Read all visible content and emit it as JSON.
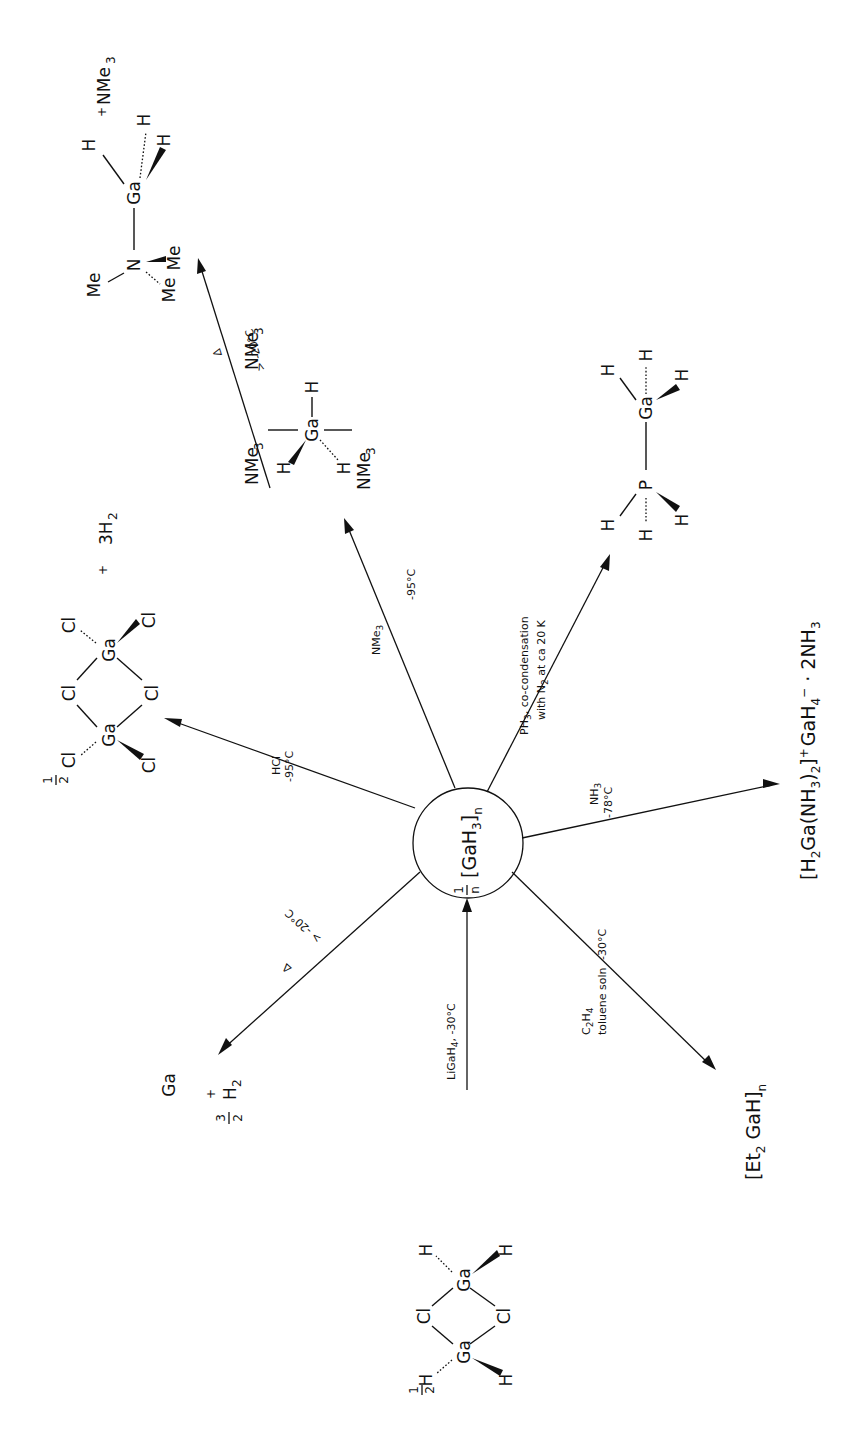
{
  "figure": {
    "orientation": "rotated 90 degrees counter-clockwise",
    "center": {
      "label_fraction_num": "1",
      "label_fraction_den": "n",
      "label_formula": "[GaH",
      "label_sub3": "3",
      "label_close": "]",
      "label_subn": "n"
    },
    "reactions": [
      {
        "id": "from-chlorogallane",
        "direction": "into center",
        "conditions": [
          "LiGaH",
          "4",
          ", -30°C"
        ],
        "species": {
          "coefficient": "1/2",
          "formula": "[H2GaCl]2",
          "atoms": [
            "H",
            "H",
            "Ga",
            "Cl",
            "Cl",
            "Ga",
            "H",
            "H"
          ]
        }
      },
      {
        "id": "decomposition",
        "conditions": [
          "Δ",
          "> -20°C"
        ],
        "product": {
          "text": "Ga + 3/2 H2",
          "ga": "Ga",
          "plus": "+",
          "num": "3",
          "den": "2",
          "h": "H",
          "h_sub": "2"
        }
      },
      {
        "id": "hcl",
        "conditions": [
          "HCl",
          "-95°C"
        ],
        "product": {
          "coefficient": "1/2",
          "formula": "Ga2Cl6",
          "atoms": [
            "Cl",
            "Cl",
            "Ga",
            "Cl",
            "Cl",
            "Ga",
            "Cl",
            "Cl"
          ],
          "plus": "+",
          "coproduct": "3H",
          "coproduct_sub": "2"
        }
      },
      {
        "id": "nme3",
        "conditions": [
          "NMe",
          "3",
          "-95°C"
        ],
        "product": {
          "formula": "H3Ga(NMe3)2",
          "ligand": "NMe",
          "ligand_sub": "3",
          "ga": "Ga",
          "h": "H"
        }
      },
      {
        "id": "nme3-decomp",
        "conditions": [
          "Δ",
          "> -20°C"
        ],
        "product": {
          "formula": "Me3N–GaH3",
          "n": "N",
          "me": "Me",
          "ga": "Ga",
          "h": "H",
          "plus": "+",
          "coproduct": "NMe",
          "coproduct_sub": "3"
        }
      },
      {
        "id": "ph3",
        "conditions": [
          "PH",
          "3",
          ", co-condensation",
          "with N",
          "2",
          " at ca 20 K"
        ],
        "product": {
          "formula": "H3P–GaH3",
          "p": "P",
          "ga": "Ga",
          "h": "H"
        }
      },
      {
        "id": "nh3",
        "conditions": [
          "NH",
          "3",
          "-78°C"
        ],
        "product": {
          "text": "[H2Ga(NH3)2]+ GaH4− · 2NH3",
          "parts": [
            "[H",
            "2",
            "Ga(NH",
            "3",
            ")",
            "2",
            "]",
            "+",
            "GaH",
            "4",
            "−",
            " · 2NH",
            "3"
          ]
        }
      },
      {
        "id": "ethylene",
        "conditions": [
          "C",
          "2",
          "H",
          "4",
          "toluene soln",
          "-30°C"
        ],
        "product": {
          "text": "[Et2GaH]n",
          "parts": [
            "[Et",
            "2",
            " GaH]",
            "n"
          ]
        }
      }
    ],
    "colors": {
      "ink": "#111111",
      "background": "#ffffff"
    }
  }
}
